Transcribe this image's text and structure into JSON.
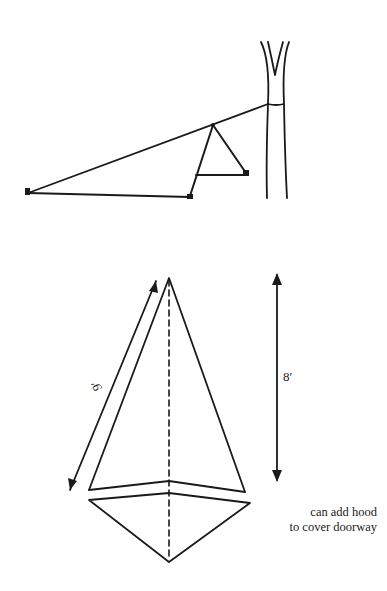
{
  "figure": {
    "top_diagram": {
      "description": "Side view of tarp shelter: rope tied to tree, A-frame support with stakes",
      "elements": [
        "tree-trunk",
        "ridge-rope",
        "a-frame-support",
        "ground-stakes"
      ]
    },
    "bottom_diagram": {
      "description": "Plan view of pyramid/diamond tarp layout with measurements",
      "dimensions": {
        "side_length": "9′",
        "height": "8′"
      },
      "note_line1": "can add hood",
      "note_line2": "to cover doorway"
    },
    "colors": {
      "ink": "#1a1a1a",
      "background": "#ffffff"
    }
  }
}
